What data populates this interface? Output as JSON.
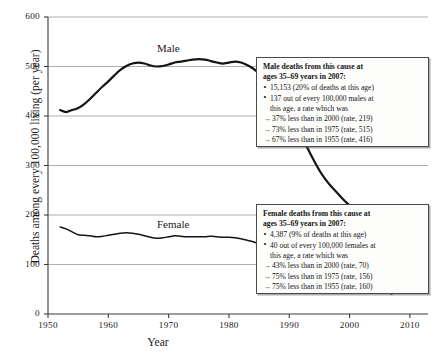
{
  "chart_data": {
    "type": "line",
    "title": "",
    "xlabel": "Year",
    "ylabel": "Deaths among every 100,000 living (per year)",
    "xlim": [
      1950,
      2013
    ],
    "ylim": [
      0,
      600
    ],
    "grid": true,
    "legend_position": "inline-series-labels",
    "xticks": [
      "1950",
      "1960",
      "1970",
      "1980",
      "1990",
      "2000",
      "2010"
    ],
    "yticks": [
      "0",
      "100",
      "200",
      "300",
      "400",
      "500",
      "600"
    ],
    "series": [
      {
        "name": "Male",
        "color": "#141414",
        "x": [
          1952,
          1953,
          1954,
          1955,
          1956,
          1957,
          1958,
          1959,
          1960,
          1961,
          1962,
          1963,
          1964,
          1965,
          1966,
          1967,
          1968,
          1969,
          1970,
          1971,
          1972,
          1973,
          1974,
          1975,
          1976,
          1977,
          1978,
          1979,
          1980,
          1981,
          1982,
          1983,
          1984,
          1985,
          1986,
          1987,
          1988,
          1989,
          1990,
          1991,
          1992,
          1993,
          1994,
          1995,
          1996,
          1997,
          1998,
          1999,
          2000,
          2001,
          2002,
          2003,
          2004,
          2005,
          2006,
          2007
        ],
        "values": [
          412,
          408,
          412,
          416,
          424,
          435,
          447,
          459,
          470,
          482,
          493,
          501,
          506,
          508,
          506,
          502,
          500,
          501,
          504,
          508,
          510,
          512,
          514,
          515,
          514,
          511,
          508,
          506,
          508,
          510,
          508,
          503,
          496,
          486,
          474,
          460,
          444,
          426,
          406,
          384,
          360,
          336,
          312,
          290,
          272,
          257,
          244,
          231,
          219,
          206,
          194,
          182,
          171,
          161,
          150,
          137
        ]
      },
      {
        "name": "Female",
        "color": "#141414",
        "x": [
          1952,
          1953,
          1954,
          1955,
          1956,
          1957,
          1958,
          1959,
          1960,
          1961,
          1962,
          1963,
          1964,
          1965,
          1966,
          1967,
          1968,
          1969,
          1970,
          1971,
          1972,
          1973,
          1974,
          1975,
          1976,
          1977,
          1978,
          1979,
          1980,
          1981,
          1982,
          1983,
          1984,
          1985,
          1986,
          1987,
          1988,
          1989,
          1990,
          1991,
          1992,
          1993,
          1994,
          1995,
          1996,
          1997,
          1998,
          1999,
          2000,
          2001,
          2002,
          2003,
          2004,
          2005,
          2006,
          2007
        ],
        "values": [
          176,
          172,
          166,
          160,
          159,
          158,
          156,
          157,
          159,
          161,
          163,
          164,
          163,
          161,
          158,
          155,
          153,
          154,
          156,
          158,
          157,
          156,
          156,
          156,
          156,
          157,
          156,
          155,
          155,
          154,
          152,
          149,
          146,
          142,
          137,
          131,
          125,
          119,
          113,
          107,
          102,
          97,
          92,
          87,
          83,
          80,
          76,
          73,
          70,
          67,
          63,
          59,
          55,
          51,
          46,
          40
        ]
      }
    ],
    "annotations": [
      {
        "id": "male-callout",
        "heading": "Male deaths from this cause at ages 35–69 years in 2007:",
        "heading_line1": "Male deaths from this cause at",
        "heading_line2": "ages 35–69 years in 2007:",
        "items": [
          {
            "marker": "bullet",
            "text": "15,153 (20% of deaths at this age)"
          },
          {
            "marker": "bullet",
            "text": "137 out of every 100,000 males at",
            "cont": "this age, a rate which was"
          },
          {
            "marker": "arrow",
            "text": "37% less than in 2000 (rate, 219)"
          },
          {
            "marker": "arrow",
            "text": "73% less than in 1975 (rate, 515)"
          },
          {
            "marker": "arrow",
            "text": "67% less than in 1955 (rate, 416)"
          }
        ]
      },
      {
        "id": "female-callout",
        "heading": "Female deaths from this cause at ages 35–69 years in 2007:",
        "heading_line1": "Female deaths from this cause at",
        "heading_line2": "ages 35–69 years in 2007:",
        "items": [
          {
            "marker": "bullet",
            "text": "4,387 (9% of deaths at this age)"
          },
          {
            "marker": "bullet",
            "text": "40 out of every 100,000 females at",
            "cont": "this age, a rate which was"
          },
          {
            "marker": "arrow",
            "text": "43% less than in 2000 (rate, 70)"
          },
          {
            "marker": "arrow",
            "text": "75% less than in 1975 (rate, 156)"
          },
          {
            "marker": "arrow",
            "text": "75% less than in 1955 (rate, 160)"
          }
        ]
      }
    ]
  },
  "colors": {
    "line": "#141414",
    "grid": "#8d8d8d",
    "axis": "#3a3a3a",
    "callout_border": "#4a4a4a",
    "callout_bg": "#fdfdfc",
    "background": "#ffffff"
  }
}
